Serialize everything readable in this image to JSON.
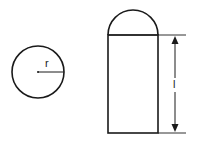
{
  "diagram": {
    "circle": {
      "label": "r",
      "cx": 38,
      "cy": 72,
      "radius": 26
    },
    "capsule": {
      "x": 108,
      "top": 35,
      "width": 50,
      "bottom": 133,
      "dome_label": ""
    },
    "dimension": {
      "label": "l"
    },
    "stroke_color": "#1a1a1a",
    "background": "#ffffff"
  }
}
